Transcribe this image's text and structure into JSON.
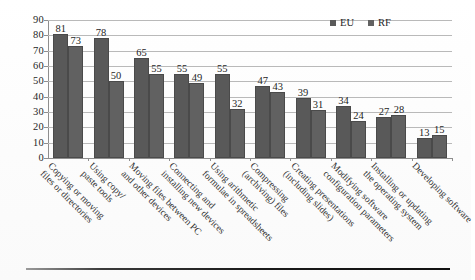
{
  "chart_data": {
    "type": "bar",
    "title": "",
    "subtitle": "",
    "xlabel": "",
    "ylabel": "",
    "ylim": [
      0,
      90
    ],
    "yticks": [
      0,
      10,
      20,
      30,
      40,
      50,
      60,
      70,
      80,
      90
    ],
    "grid": true,
    "legend_position": "top-right",
    "categories": [
      "Copying or moving files or directories",
      "Using copy/ paste tools",
      "Moving files between PC and other devices",
      "Connecting and installing new devices",
      "Using arithmetic formulae in spreadsheets",
      "Compressing (archiving) files",
      "Creating presentations (including slides)",
      "Modifying software configuration parameters",
      "Installing or updating the operating system",
      "Developing software"
    ],
    "category_lines": [
      [
        "Copying or moving",
        "files or directories"
      ],
      [
        "Using copy/",
        "paste tools"
      ],
      [
        "Moving files between PC",
        "and other devices"
      ],
      [
        "Connecting and",
        "installing new devices"
      ],
      [
        "Using arithmetic",
        "formulae in spreadsheets"
      ],
      [
        "Compressing",
        "(archiving) files"
      ],
      [
        "Creating presentations",
        "(including slides)"
      ],
      [
        "Modifying software",
        "configuration parameters"
      ],
      [
        "Installing or updating",
        "the operating system"
      ],
      [
        "Developing software",
        ""
      ]
    ],
    "series": [
      {
        "name": "EU",
        "color": "#595959",
        "values": [
          81,
          78,
          65,
          55,
          55,
          47,
          39,
          34,
          27,
          13
        ]
      },
      {
        "name": "RF",
        "color": "#616161",
        "values": [
          73,
          50,
          55,
          49,
          32,
          43,
          31,
          24,
          28,
          15
        ]
      }
    ]
  },
  "legend": {
    "items": [
      {
        "label": "EU",
        "color": "#595959"
      },
      {
        "label": "RF",
        "color": "#616161"
      }
    ]
  },
  "axes": {
    "y": {
      "ticks": [
        "0",
        "10",
        "20",
        "30",
        "40",
        "50",
        "60",
        "70",
        "80",
        "90"
      ],
      "min": 0,
      "max": 90
    }
  }
}
